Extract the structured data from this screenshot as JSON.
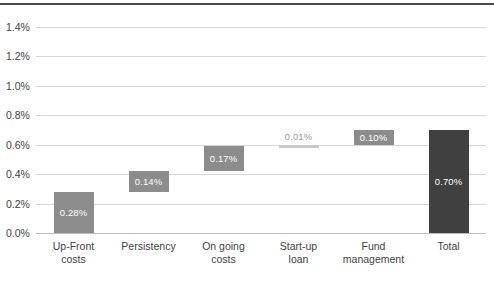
{
  "chart_data": {
    "type": "bar",
    "subtype": "waterfall",
    "title": "",
    "xlabel": "",
    "ylabel": "",
    "ylim": [
      0.0,
      1.4
    ],
    "ytick_labels": [
      "1.4%",
      "1.2%",
      "1.0%",
      "0.8%",
      "0.6%",
      "0.4%",
      "0.2%",
      "0.0%"
    ],
    "ytick_values": [
      1.4,
      1.2,
      1.0,
      0.8,
      0.6,
      0.4,
      0.2,
      0.0
    ],
    "grid": true,
    "legend": "none",
    "categories": [
      "Up-Front costs",
      "Persistency",
      "On going costs",
      "Start-up loan",
      "Fund management",
      "Total"
    ],
    "values": [
      0.28,
      0.14,
      0.17,
      0.01,
      0.1,
      0.7
    ],
    "data_labels": [
      "0.28%",
      "0.14%",
      "0.17%",
      "0.01%",
      "0.10%",
      "0.70%"
    ],
    "bars": [
      {
        "category": "Up-Front costs",
        "label_line1": "Up-Front",
        "label_line2": "costs",
        "value": 0.28,
        "data_label": "0.28%",
        "base": 0.0,
        "top": 0.28,
        "style": "normal"
      },
      {
        "category": "Persistency",
        "label_line1": "Persistency",
        "label_line2": "",
        "value": 0.14,
        "data_label": "0.14%",
        "base": 0.28,
        "top": 0.42,
        "style": "normal"
      },
      {
        "category": "On going costs",
        "label_line1": "On going",
        "label_line2": "costs",
        "value": 0.17,
        "data_label": "0.17%",
        "base": 0.42,
        "top": 0.59,
        "style": "normal"
      },
      {
        "category": "Start-up loan",
        "label_line1": "Start-up",
        "label_line2": "loan",
        "value": 0.01,
        "data_label": "0.01%",
        "base": 0.59,
        "top": 0.6,
        "style": "sliver"
      },
      {
        "category": "Fund management",
        "label_line1": "Fund",
        "label_line2": "management",
        "value": 0.1,
        "data_label": "0.10%",
        "base": 0.6,
        "top": 0.7,
        "style": "normal"
      },
      {
        "category": "Total",
        "label_line1": "Total",
        "label_line2": "",
        "value": 0.7,
        "data_label": "0.70%",
        "base": 0.0,
        "top": 0.7,
        "style": "total"
      }
    ],
    "colors": {
      "bar": "#8c8c8c",
      "total_bar": "#404040",
      "sliver_bar": "#c9c9c9",
      "gridline": "#d6d6d6",
      "axis": "#bdbdbd",
      "text": "#3f3f3f",
      "bar_label_text": "#ffffff",
      "sliver_label_text": "#9a9a9a",
      "top_rule": "#4a4a4a",
      "background": "#ffffff"
    }
  }
}
